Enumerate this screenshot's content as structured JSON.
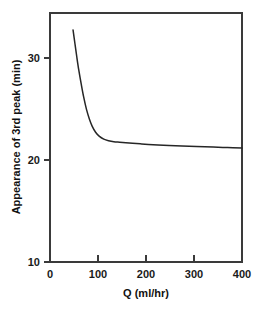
{
  "chart_data": {
    "type": "line",
    "title": "",
    "subtitle": "",
    "xlabel": "Q (ml/hr)",
    "ylabel": "Appearance of 3rd peak (min)",
    "xlim": [
      0,
      400
    ],
    "ylim": [
      10,
      33.5
    ],
    "xticks": [
      0,
      100,
      200,
      300,
      400
    ],
    "xticklabels": [
      "0",
      "100",
      "200",
      "300",
      "400"
    ],
    "yticks": [
      10,
      20,
      30
    ],
    "yticklabels": [
      "10",
      "20",
      "30"
    ],
    "grid": false,
    "legend": null,
    "legend_position": "none",
    "annotations": [],
    "series": [
      {
        "name": "Appearance of 3rd peak",
        "color": "#262626",
        "x": [
          48,
          52,
          56,
          60,
          65,
          70,
          76,
          82,
          88,
          95,
          103,
          112,
          122,
          133,
          145,
          158,
          172,
          188,
          205,
          225,
          248,
          275,
          305,
          340,
          370,
          400
        ],
        "y": [
          31.9,
          30.6,
          29.3,
          28.1,
          26.8,
          25.6,
          24.4,
          23.5,
          22.8,
          22.25,
          21.85,
          21.6,
          21.45,
          21.35,
          21.3,
          21.25,
          21.2,
          21.15,
          21.1,
          21.05,
          21.0,
          20.95,
          20.9,
          20.85,
          20.8,
          20.75
        ]
      }
    ]
  },
  "axes": {
    "x_axis_name": "Q",
    "x_axis_units": "ml/hr",
    "y_axis_name": "Appearance of 3rd peak",
    "y_axis_units": "min"
  },
  "colors": {
    "curve": "#262626",
    "frame": "#3a3a3a",
    "background": "#ffffff",
    "text": "#1a1a1a"
  }
}
